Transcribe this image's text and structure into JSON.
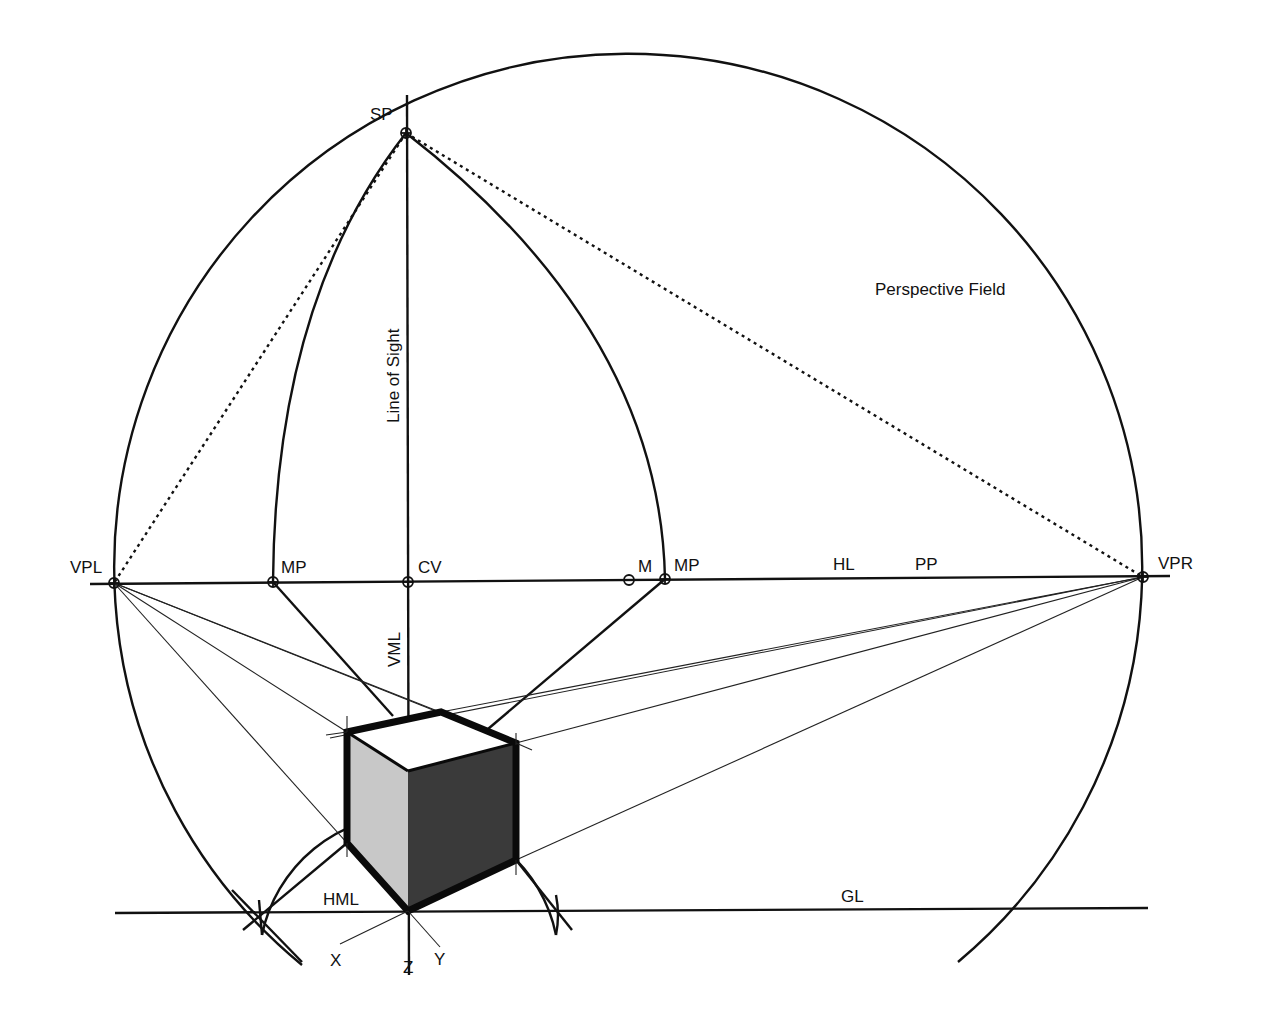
{
  "diagram": {
    "colors": {
      "ink": "#111111",
      "background": "#ffffff",
      "cube_light_face": "#c8c8c8",
      "cube_dark_face": "#3a3a3a",
      "cube_top_face": "#ffffff"
    },
    "labels": {
      "sp": "SP",
      "vpl": "VPL",
      "vpr": "VPR",
      "mp_left": "MP",
      "mp_right": "MP",
      "cv": "CV",
      "m": "M",
      "hl": "HL",
      "pp": "PP",
      "gl": "GL",
      "hml": "HML",
      "vml": "VML",
      "line_of_sight": "Line of Sight",
      "perspective_field": "Perspective Field",
      "axis_x": "X",
      "axis_y": "Y",
      "axis_z": "Z"
    },
    "points": [
      {
        "id": "SP",
        "x": 406,
        "y": 133
      },
      {
        "id": "VPL",
        "x": 114,
        "y": 583
      },
      {
        "id": "MP_left",
        "x": 273,
        "y": 582
      },
      {
        "id": "CV",
        "x": 408,
        "y": 582
      },
      {
        "id": "M",
        "x": 629,
        "y": 580
      },
      {
        "id": "MP_right",
        "x": 665,
        "y": 579
      },
      {
        "id": "VPR",
        "x": 1143,
        "y": 577
      }
    ]
  }
}
